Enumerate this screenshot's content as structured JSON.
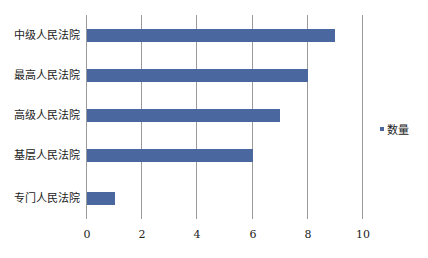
{
  "chart_data": {
    "type": "bar",
    "orientation": "horizontal",
    "title": "",
    "xlabel": "",
    "ylabel": "",
    "categories": [
      "中级人民法院",
      "最高人民法院",
      "高级人民法院",
      "基层人民法院",
      "专门人民法院"
    ],
    "series": [
      {
        "name": "数量",
        "values": [
          9,
          8,
          7,
          6,
          1
        ],
        "color": "#4a67a0"
      }
    ],
    "xlim": [
      0,
      10
    ],
    "xticks": [
      "0",
      "2",
      "4",
      "6",
      "8",
      "10"
    ],
    "grid": "vertical",
    "legend_position": "right"
  },
  "legend": {
    "label": "数量"
  }
}
